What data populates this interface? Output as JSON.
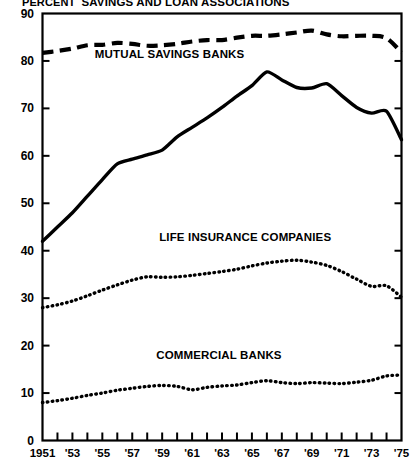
{
  "chart_data": {
    "type": "line",
    "title": "",
    "ylabel": "PERCENT",
    "xlabel": "",
    "ylim": [
      0,
      90
    ],
    "xlim": [
      1951,
      1975
    ],
    "ytick_step": 10,
    "yticks": [
      "0",
      "10",
      "20",
      "30",
      "40",
      "50",
      "60",
      "70",
      "80",
      "90"
    ],
    "xticks": [
      1951,
      1952,
      1953,
      1954,
      1955,
      1956,
      1957,
      1958,
      1959,
      1960,
      1961,
      1962,
      1963,
      1964,
      1965,
      1966,
      1967,
      1968,
      1969,
      1970,
      1971,
      1972,
      1973,
      1974,
      1975
    ],
    "xtick_labels": [
      "1951",
      "",
      "'53",
      "",
      "'55",
      "",
      "'57",
      "",
      "'59",
      "",
      "'61",
      "",
      "'63",
      "",
      "'65",
      "",
      "'67",
      "",
      "'69",
      "",
      "'71",
      "",
      "'73",
      "",
      "'75"
    ],
    "grid": false,
    "legend_position": "inline-annotations",
    "x": [
      1951,
      1952,
      1953,
      1954,
      1955,
      1956,
      1957,
      1958,
      1959,
      1960,
      1961,
      1962,
      1963,
      1964,
      1965,
      1966,
      1967,
      1968,
      1969,
      1970,
      1971,
      1972,
      1973,
      1974,
      1975
    ],
    "series": [
      {
        "name": "SAVINGS AND LOAN ASSOCIATIONS",
        "style": "dashed",
        "color": "#000000",
        "label_x": 1953.6,
        "label_y": 92.0,
        "values": [
          81.7,
          82.1,
          82.6,
          83.3,
          83.4,
          83.8,
          83.6,
          83.2,
          83.3,
          83.6,
          84.1,
          84.4,
          84.4,
          84.9,
          85.3,
          85.3,
          85.6,
          86.0,
          86.4,
          85.6,
          85.2,
          85.3,
          85.3,
          84.8,
          81.8
        ]
      },
      {
        "name": "MUTUAL SAVINGS BANKS",
        "style": "solid",
        "color": "#000000",
        "label_x": 1954.5,
        "label_y": 81.0,
        "values": [
          42.0,
          45.0,
          48.0,
          51.5,
          55.0,
          58.3,
          59.3,
          60.2,
          61.2,
          64.0,
          66.0,
          68.0,
          70.2,
          72.6,
          74.8,
          77.7,
          76.0,
          74.4,
          74.3,
          75.2,
          72.7,
          70.2,
          69.0,
          69.4,
          63.4
        ]
      },
      {
        "name": "LIFE INSURANCE COMPANIES",
        "style": "dotted",
        "color": "#000000",
        "label_x": 1958.8,
        "label_y": 42.5,
        "values": [
          28.0,
          28.6,
          29.4,
          30.5,
          31.7,
          32.8,
          33.8,
          34.5,
          34.4,
          34.5,
          34.8,
          35.2,
          35.6,
          36.1,
          36.8,
          37.4,
          37.8,
          38.0,
          37.6,
          36.9,
          35.6,
          34.0,
          32.5,
          32.6,
          30.2
        ]
      },
      {
        "name": "COMMERCIAL BANKS",
        "style": "dotted",
        "color": "#000000",
        "label_x": 1958.6,
        "label_y": 17.5,
        "values": [
          8.0,
          8.4,
          8.9,
          9.5,
          10.0,
          10.6,
          11.0,
          11.4,
          11.6,
          11.4,
          10.7,
          11.2,
          11.5,
          11.7,
          12.2,
          12.6,
          12.2,
          12.0,
          12.2,
          12.1,
          12.0,
          12.3,
          12.7,
          13.6,
          13.8
        ]
      }
    ]
  }
}
